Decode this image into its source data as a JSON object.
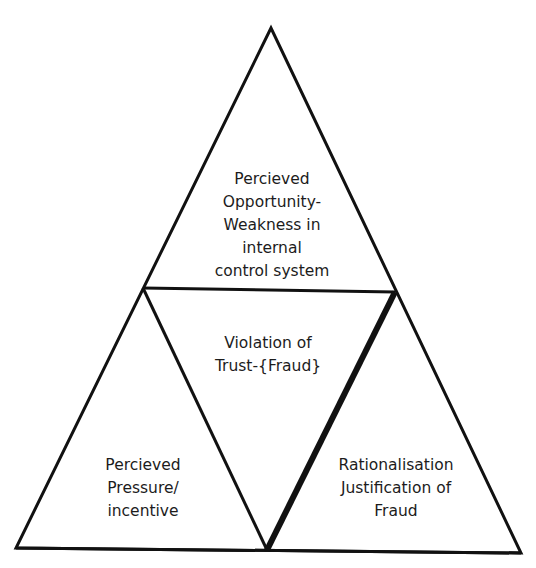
{
  "diagram": {
    "colors": {
      "stroke": "#111111",
      "text": "#1c1c1c",
      "background": "#ffffff"
    },
    "nodes": {
      "top": {
        "lines": [
          "Percieved",
          "Opportunity-",
          "Weakness in",
          "internal",
          "control system"
        ]
      },
      "center": {
        "lines": [
          "Violation of",
          "Trust-{Fraud}"
        ]
      },
      "bottom_left": {
        "lines": [
          "Percieved",
          "Pressure/",
          "incentive"
        ]
      },
      "bottom_right": {
        "lines": [
          "Rationalisation",
          "Justification of",
          "Fraud"
        ]
      }
    }
  }
}
